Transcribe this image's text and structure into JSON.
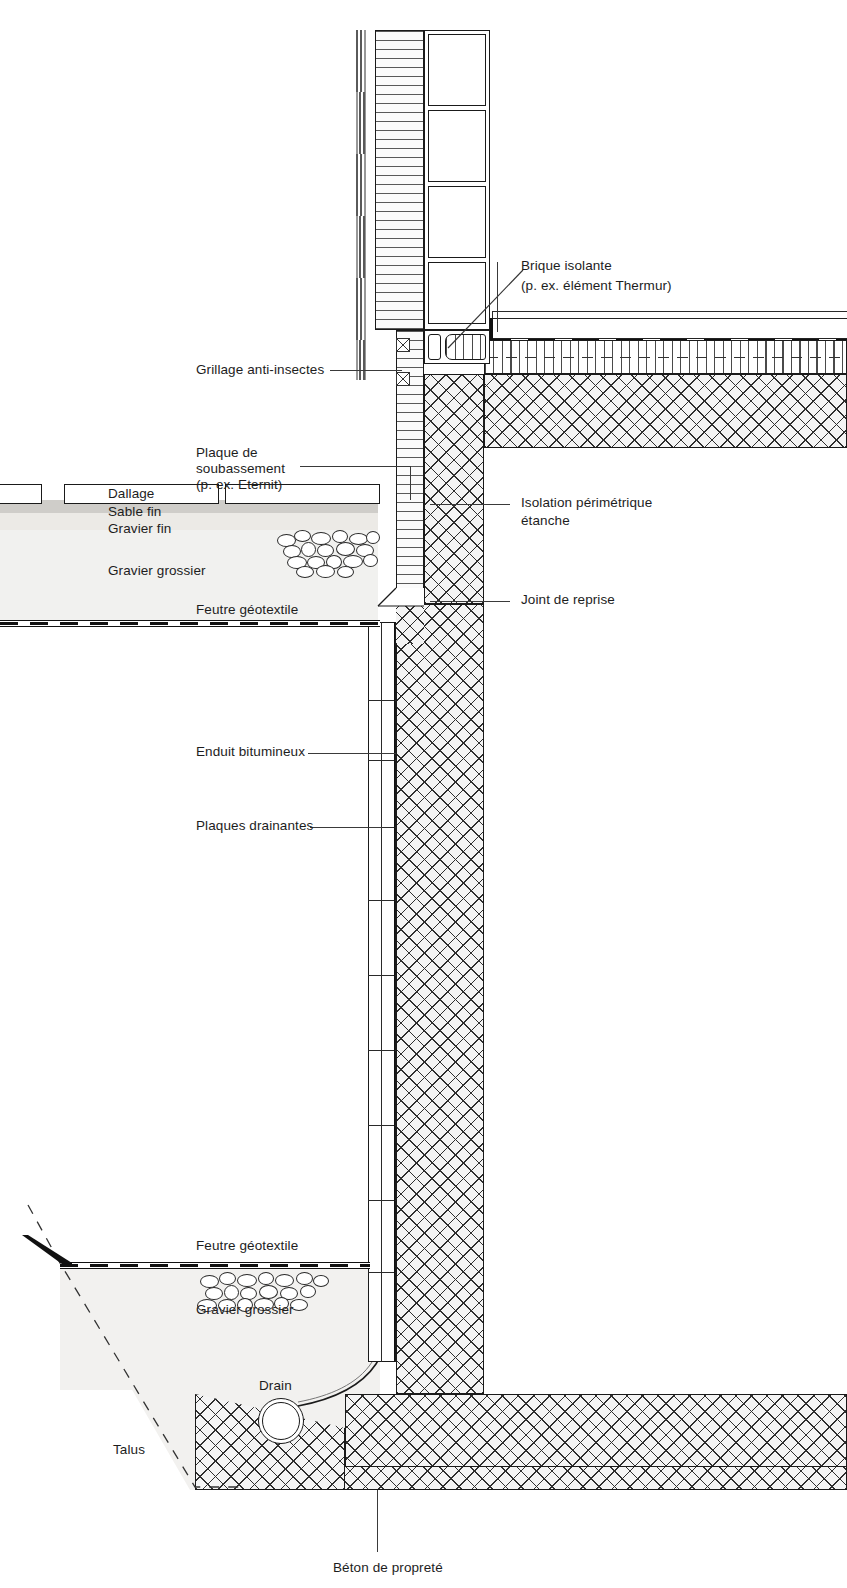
{
  "diagram": {
    "language": "fr"
  },
  "labels": {
    "brique_isolante_l1": "Brique isolante",
    "brique_isolante_l2": "(p. ex. élément Thermur)",
    "grillage": "Grillage anti-insectes",
    "plaque_l1": "Plaque de",
    "plaque_l2": "soubassement",
    "plaque_l3": "(p. ex. Eternit)",
    "isolation_l1": "Isolation périmétrique",
    "isolation_l2": "étanche",
    "joint_reprise": "Joint de reprise",
    "enduit": "Enduit bitumineux",
    "plaques_drainantes": "Plaques drainantes",
    "dallage": "Dallage",
    "sable_fin": "Sable fin",
    "gravier_fin": "Gravier fin",
    "gravier_grossier_haut": "Gravier grossier",
    "feutre_haut": "Feutre géotextile",
    "feutre_bas": "Feutre géotextile",
    "gravier_grossier_bas": "Gravier grossier",
    "drain": "Drain",
    "talus": "Talus",
    "beton_proprete": "Béton de propreté"
  },
  "colors": {
    "ink": "#1a1a1a",
    "hatch": "#2e2e2e",
    "soil_coarse": "#f1f1ef",
    "soil_fine": "#eceae6",
    "soil_sand": "#cfcdc9",
    "paper": "#ffffff"
  },
  "structure": {
    "wall_material": "concrete-cross-hatch",
    "floor_layers": [
      "dalle-beton",
      "isolation-perimetrique",
      "chape"
    ],
    "drain_shape": "circle",
    "talus_style": "dashed"
  }
}
